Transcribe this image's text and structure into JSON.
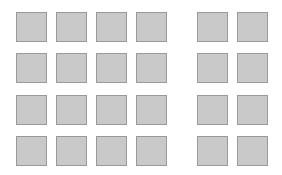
{
  "canvas": {
    "width": 282,
    "height": 175,
    "background": "#ffffff"
  },
  "squares": {
    "fill": "#c9c9c9",
    "border": "#9a9a9a",
    "size": 30,
    "columns_x": [
      16,
      56,
      96,
      136,
      197,
      237
    ],
    "rows_y": [
      12,
      53,
      95,
      136
    ],
    "groups": [
      {
        "name": "left-group",
        "columns": 4,
        "rows": 4
      },
      {
        "name": "right-group",
        "columns": 2,
        "rows": 4
      }
    ]
  }
}
